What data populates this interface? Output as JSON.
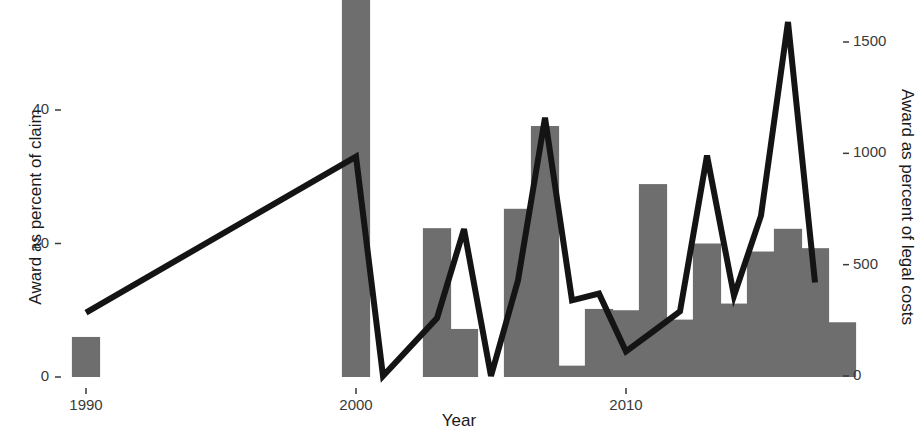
{
  "chart_data": {
    "type": "bar",
    "title": "",
    "xlabel": "Year",
    "ylabel": "Award as percent of claim",
    "y2label": "Award as percent of legal costs",
    "grid": false,
    "legend": null,
    "xlim": [
      1988.5,
      2018.0
    ],
    "ylim": [
      0,
      57
    ],
    "y2lim": [
      0,
      2140
    ],
    "xticks": [
      "1990",
      "2000",
      "2010"
    ],
    "xtick_values": [
      1990,
      2000,
      2010
    ],
    "yticks": [
      "0",
      "20",
      "40"
    ],
    "ytick_values": [
      0,
      20,
      40
    ],
    "y2ticks": [
      "0",
      "500",
      "1000",
      "1500"
    ],
    "y2tick_values": [
      0,
      500,
      1000,
      1500
    ],
    "bar_color": "#6e6e6e",
    "line_color": "#141414",
    "series": [
      {
        "name": "Award as percent of claim",
        "axis": "left",
        "render": "bar",
        "x": [
          1990,
          2000,
          2003,
          2004,
          2006,
          2007,
          2008,
          2009,
          2010,
          2011,
          2012,
          2013,
          2014,
          2015,
          2016,
          2017
        ],
        "values": [
          6.0,
          57.0,
          22.3,
          7.2,
          25.2,
          37.6,
          1.7,
          10.2,
          10.0,
          28.9,
          8.6,
          20.0,
          11.0,
          18.8,
          22.2,
          19.3
        ]
      },
      {
        "name": "Award as percent of legal costs",
        "axis": "right",
        "render": "line",
        "x": [
          1990,
          2000,
          2001,
          2003,
          2004,
          2005,
          2006,
          2007,
          2008,
          2009,
          2010,
          2011,
          2012,
          2013,
          2014,
          2015,
          2016,
          2017
        ],
        "values": [
          285,
          985,
          0,
          260,
          660,
          0,
          430,
          1160,
          340,
          370,
          110,
          200,
          290,
          990,
          360,
          720,
          1590,
          420
        ]
      }
    ]
  },
  "extra_bar": {
    "note": "bar at 2017 right edge",
    "x": 2018,
    "value": 8.2
  }
}
